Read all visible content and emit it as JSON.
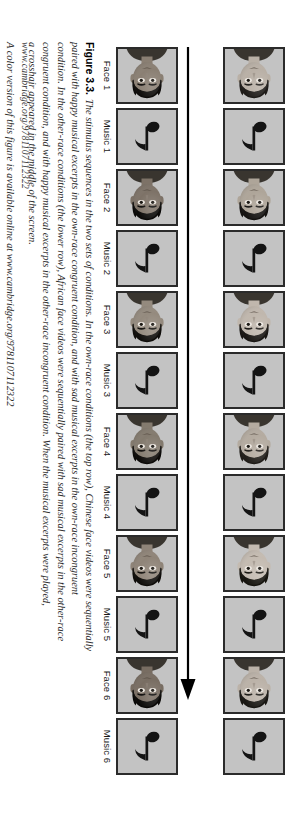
{
  "figure": {
    "number_label": "Figure 3.3.",
    "sequence_arrow_name": "sequence-direction-arrow",
    "rows": [
      {
        "row_name": "own-race-row",
        "panels": [
          {
            "type": "face",
            "label": "Face 1",
            "skin": "#b9b0a6",
            "hair": "#1f1c19"
          },
          {
            "type": "music",
            "label": "Music 1"
          },
          {
            "type": "face",
            "label": "Face 2",
            "skin": "#aea599",
            "hair": "#141210"
          },
          {
            "type": "music",
            "label": "Music 2"
          },
          {
            "type": "face",
            "label": "Face 3",
            "skin": "#c0b7ad",
            "hair": "#1a1714"
          },
          {
            "type": "music",
            "label": "Music 3"
          },
          {
            "type": "face",
            "label": "Face 4",
            "skin": "#b4aba0",
            "hair": "#201d19"
          },
          {
            "type": "music",
            "label": "Music 4"
          },
          {
            "type": "face",
            "label": "Face 5",
            "skin": "#c4bbb1",
            "hair": "#17150f"
          },
          {
            "type": "music",
            "label": "Music 5"
          },
          {
            "type": "face",
            "label": "Face 6",
            "skin": "#bbb2a8",
            "hair": "#191713"
          },
          {
            "type": "music",
            "label": "Music 6"
          }
        ]
      },
      {
        "row_name": "other-race-row",
        "panels": [
          {
            "type": "face",
            "label": "Face 1",
            "skin": "#8a7f73",
            "hair": "#0e0c0a"
          },
          {
            "type": "music",
            "label": "Music 1"
          },
          {
            "type": "face",
            "label": "Face 2",
            "skin": "#7d7267",
            "hair": "#0b0a08"
          },
          {
            "type": "music",
            "label": "Music 2"
          },
          {
            "type": "face",
            "label": "Face 3",
            "skin": "#948a7e",
            "hair": "#100e0b"
          },
          {
            "type": "music",
            "label": "Music 3"
          },
          {
            "type": "face",
            "label": "Face 4",
            "skin": "#837a6e",
            "hair": "#0d0b09"
          },
          {
            "type": "music",
            "label": "Music 4"
          },
          {
            "type": "face",
            "label": "Face 5",
            "skin": "#8f8478",
            "hair": "#0f0d0a"
          },
          {
            "type": "music",
            "label": "Music 5"
          },
          {
            "type": "face",
            "label": "Face 6",
            "skin": "#786d62",
            "hair": "#0a0907"
          },
          {
            "type": "music",
            "label": "Music 6"
          }
        ]
      }
    ],
    "labels": [
      "Face 1",
      "Music 1",
      "Face 2",
      "Music 2",
      "Face 3",
      "Music 3",
      "Face 4",
      "Music 4",
      "Face 5",
      "Music 5",
      "Face 6",
      "Music 6"
    ],
    "caption": {
      "number": "Figure 3.3.",
      "lines": [
        "The stimulus sequences in the two sets of conditions. In the own-race conditions (the top row), Chinese face videos were sequentially",
        "paired with happy musical excerpts in the own-race congruent condition, and with sad musical excerpts in the own-race incongruent",
        "condition. In the other-race conditions (the lower row), African face videos were sequentially paired with sad musical excerpts in the other-race",
        "congruent condition, and with happy musical excerpts in the other-race incongruent condition. When the musical excerpts were played,",
        "a crosshair appeared in the middle of the screen."
      ],
      "note": "A color version of this figure is available online at www.cambridge.org/9781107112322"
    },
    "footer_url": "www.cambridge.org/9781107112322"
  }
}
